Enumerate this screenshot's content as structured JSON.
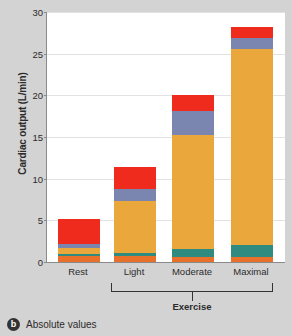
{
  "chart_data": {
    "type": "bar",
    "stacked": true,
    "title": "",
    "xlabel": "",
    "ylabel": "Cardiac output (L/min)",
    "categories": [
      "Rest",
      "Light",
      "Moderate",
      "Maximal"
    ],
    "group_label": "Exercise",
    "group_members": [
      "Light",
      "Moderate",
      "Maximal"
    ],
    "ylim": [
      0,
      30
    ],
    "yticks": [
      0,
      5,
      10,
      15,
      20,
      25,
      30
    ],
    "ytick_labels": [
      "0",
      "5",
      "10",
      "15",
      "20",
      "25",
      "30"
    ],
    "grid": true,
    "legend": "none",
    "totals": [
      5.2,
      11.4,
      20.0,
      28.2
    ],
    "series": [
      {
        "name": "abdominal-organs",
        "color": "#e8702a",
        "values": [
          0.7,
          0.7,
          0.6,
          0.6
        ]
      },
      {
        "name": "heart-coronary",
        "color": "#2f8a80",
        "values": [
          0.25,
          0.35,
          0.95,
          1.4
        ]
      },
      {
        "name": "skeletal-muscle",
        "color": "#eaa83c",
        "values": [
          0.75,
          6.3,
          13.7,
          23.6
        ]
      },
      {
        "name": "brain",
        "color": "#7b86b0",
        "values": [
          0.5,
          1.45,
          2.9,
          1.3
        ]
      },
      {
        "name": "skin-other",
        "color": "#ef2b1e",
        "values": [
          3.0,
          2.6,
          1.85,
          1.3
        ]
      }
    ]
  },
  "axis": {
    "y_title": "Cardiac output (L/min)"
  },
  "caption": {
    "badge": "b",
    "text": "Absolute values"
  }
}
